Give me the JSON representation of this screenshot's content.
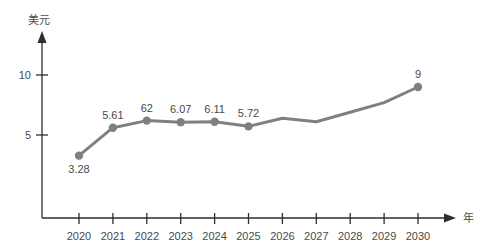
{
  "chart_data": {
    "type": "line",
    "title": "",
    "subtitle": "",
    "xlabel": "年",
    "ylabel": "美元",
    "categories": [
      "2020",
      "2021",
      "2022",
      "2023",
      "2024",
      "2025",
      "2026",
      "2027",
      "2028",
      "2029",
      "2030"
    ],
    "x": [
      2020,
      2021,
      2022,
      2023,
      2024,
      2025,
      2026,
      2027,
      2028,
      2029,
      2030
    ],
    "values": [
      3.28,
      5.61,
      6.2,
      6.07,
      6.11,
      5.72,
      6.4,
      6.1,
      6.9,
      7.7,
      9.0
    ],
    "point_labels": [
      "3.28",
      "5.61",
      "62",
      "6.07",
      "6.11",
      "5.72",
      "",
      "",
      "",
      "",
      "9"
    ],
    "labelled_points": [
      true,
      true,
      true,
      true,
      true,
      true,
      false,
      false,
      false,
      false,
      true
    ],
    "markers": [
      true,
      true,
      true,
      true,
      true,
      true,
      false,
      false,
      false,
      false,
      true
    ],
    "ylim": [
      0,
      12.5
    ],
    "yticks": [
      5,
      10
    ],
    "ytick_labels": [
      "5",
      "10"
    ],
    "grid": false,
    "legend": null,
    "legend_position": "none",
    "series_color": "#808080",
    "axis_color": "#2e2e2e",
    "text_color": "#4a4a4a",
    "background": "#ffffff"
  },
  "axis": {
    "y_title": "美元",
    "x_title": "年"
  }
}
